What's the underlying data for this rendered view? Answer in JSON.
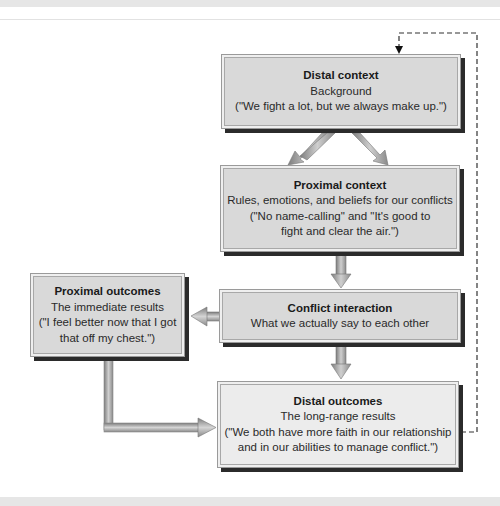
{
  "diagram": {
    "boxes": {
      "distal_context": {
        "title": "Distal context",
        "lines": [
          "Background",
          "(\"We fight a lot, but we always make up.\")"
        ]
      },
      "proximal_context": {
        "title": "Proximal context",
        "lines": [
          "Rules, emotions, and beliefs for our conflicts",
          "(\"No name-calling\" and \"It's good to",
          "fight and clear the air.\")"
        ]
      },
      "conflict_interaction": {
        "title": "Conflict interaction",
        "lines": [
          "What we actually say to each other"
        ]
      },
      "proximal_outcomes": {
        "title": "Proximal outcomes",
        "lines": [
          "The immediate results",
          "(\"I feel better now that I got",
          "that off my chest.\")"
        ]
      },
      "distal_outcomes": {
        "title": "Distal outcomes",
        "lines": [
          "The long-range results",
          "(\"We both have more faith in our relationship",
          "and in our abilities to manage conflict.\")"
        ]
      }
    },
    "connections": [
      {
        "from": "distal_context",
        "to": "proximal_context",
        "style": "double-solid"
      },
      {
        "from": "proximal_context",
        "to": "conflict_interaction",
        "style": "solid"
      },
      {
        "from": "conflict_interaction",
        "to": "proximal_outcomes",
        "style": "solid"
      },
      {
        "from": "conflict_interaction",
        "to": "distal_outcomes",
        "style": "solid"
      },
      {
        "from": "proximal_outcomes",
        "to": "distal_outcomes",
        "style": "elbow-solid"
      },
      {
        "from": "distal_outcomes",
        "to": "distal_context",
        "style": "dashed-feedback"
      }
    ],
    "colors": {
      "box_fill": "#d9d9d9",
      "box_fill_light": "#ececec",
      "shadow": "#2b2b2b",
      "arrow": "#9c9c9c",
      "dashed": "#333333"
    }
  }
}
